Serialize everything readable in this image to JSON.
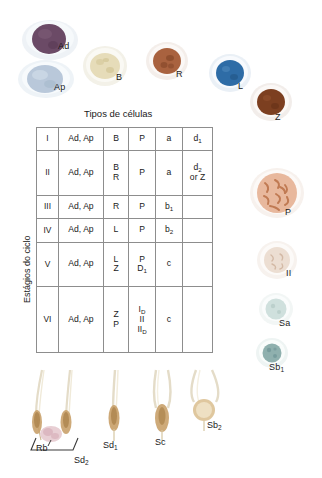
{
  "figure": {
    "table_title": "Tipos de células",
    "axis_title": "Estágios do ciclo"
  },
  "cells_top": [
    {
      "key": "Ad",
      "label": "Ad",
      "fill": "#6b4a66",
      "rim": "#e9eef2",
      "shape": "oval",
      "x": 22,
      "y": 20,
      "w": 46,
      "h": 34,
      "lx": 58,
      "ly": 47
    },
    {
      "key": "Ap",
      "label": "Ap",
      "fill": "#b9c8da",
      "rim": "#eef3f7",
      "shape": "oval",
      "x": 20,
      "y": 60,
      "w": 46,
      "h": 32,
      "lx": 56,
      "ly": 87
    },
    {
      "key": "B",
      "label": "B",
      "fill": "#e6dcb9",
      "rim": "#f4f1e6",
      "shape": "round",
      "x": 85,
      "y": 46,
      "w": 38,
      "h": 36,
      "lx": 118,
      "ly": 78
    },
    {
      "key": "R",
      "label": "R",
      "fill": "#a9623f",
      "rim": "#f2eae6",
      "shape": "round",
      "x": 148,
      "y": 42,
      "w": 36,
      "h": 34,
      "lx": 178,
      "ly": 74
    },
    {
      "key": "L",
      "label": "L",
      "fill": "#2e6ca6",
      "rim": "#e8eef5",
      "shape": "round",
      "x": 211,
      "y": 54,
      "w": 36,
      "h": 34,
      "lx": 240,
      "ly": 86
    },
    {
      "key": "Z",
      "label": "Z",
      "fill": "#7c3f20",
      "rim": "#f0ebe7",
      "shape": "round",
      "x": 252,
      "y": 83,
      "w": 36,
      "h": 34,
      "lx": 277,
      "ly": 118
    }
  ],
  "cells_right": [
    {
      "key": "P",
      "label": "P",
      "fill": "#e3a98c",
      "rim": "#f7efea",
      "shape": "round",
      "x": 253,
      "y": 169,
      "w": 46,
      "h": 44,
      "lx": 287,
      "ly": 212
    },
    {
      "key": "II",
      "label": "II",
      "fill": "#ecded2",
      "rim": "#f8f4f1",
      "shape": "round",
      "x": 261,
      "y": 243,
      "w": 32,
      "h": 30,
      "lx": 288,
      "ly": 272
    },
    {
      "key": "Sa",
      "label": "Sa",
      "fill": "#cfe0dd",
      "rim": "#f1f6f5",
      "shape": "round",
      "x": 263,
      "y": 295,
      "w": 26,
      "h": 25,
      "lx": 282,
      "ly": 321
    },
    {
      "key": "Sb1",
      "label": "Sb",
      "sub": "1",
      "fill": "#8fb0ae",
      "rim": "#eef4f3",
      "shape": "round",
      "x": 260,
      "y": 340,
      "w": 24,
      "h": 23,
      "lx": 272,
      "ly": 366
    }
  ],
  "table": {
    "columns": 6,
    "rows": [
      {
        "stage": "I",
        "col2": [
          "Ad, Ap"
        ],
        "col3": [
          "B"
        ],
        "col4": [
          "P"
        ],
        "col5": [
          "a"
        ],
        "col6": [
          "d|1"
        ]
      },
      {
        "stage": "II",
        "col2": [
          "Ad, Ap"
        ],
        "col3": [
          "B",
          "R"
        ],
        "col4": [
          "P"
        ],
        "col5": [
          "a"
        ],
        "col6": [
          "d|2",
          "or Z"
        ]
      },
      {
        "stage": "III",
        "col2": [
          "Ad, Ap"
        ],
        "col3": [
          "R"
        ],
        "col4": [
          "P"
        ],
        "col5": [
          "b|1"
        ],
        "col6": []
      },
      {
        "stage": "IV",
        "col2": [
          "Ad, Ap"
        ],
        "col3": [
          "L"
        ],
        "col4": [
          "P"
        ],
        "col5": [
          "b|2"
        ],
        "col6": []
      },
      {
        "stage": "V",
        "col2": [
          "Ad, Ap"
        ],
        "col3": [
          "L",
          "Z"
        ],
        "col4": [
          "P",
          "D|1"
        ],
        "col5": [
          "c"
        ],
        "col6": []
      },
      {
        "stage": "VI",
        "col2": [
          "Ad, Ap"
        ],
        "col3": [
          "Z",
          "P"
        ],
        "col4": [
          "I|D",
          "II",
          "II|D"
        ],
        "col5": [
          "c"
        ],
        "col6": []
      }
    ]
  },
  "spermatids": [
    {
      "key": "Sd2",
      "label": "Sd",
      "sub": "2"
    },
    {
      "key": "Rb",
      "label": "Rb",
      "sub": ""
    },
    {
      "key": "Sd1",
      "label": "Sd",
      "sub": "1"
    },
    {
      "key": "Sc",
      "label": "Sc",
      "sub": ""
    },
    {
      "key": "Sb2",
      "label": "Sb",
      "sub": "2"
    }
  ],
  "colors": {
    "table_border": "#3a3a3a",
    "table_gridline": "#8d8d8d",
    "text": "#1a1a1a",
    "background": "#ffffff"
  }
}
